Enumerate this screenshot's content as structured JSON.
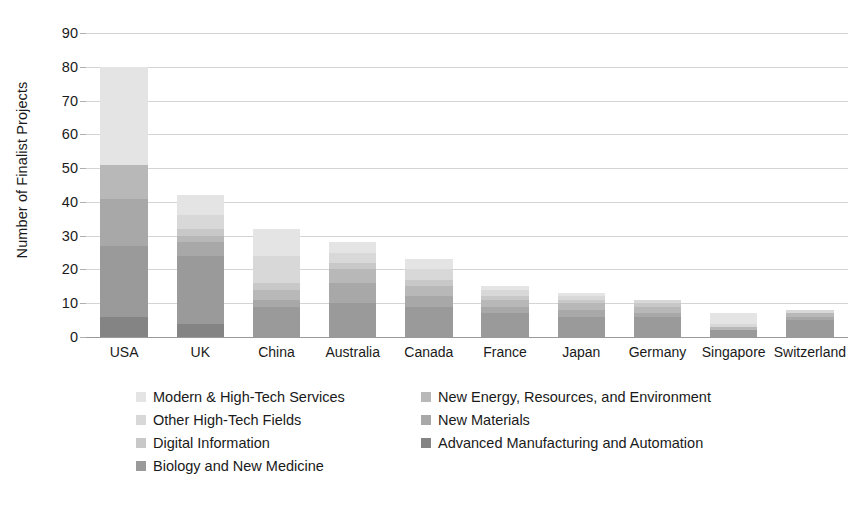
{
  "chart_data": {
    "type": "bar",
    "subtype": "stacked-bar",
    "title": "",
    "xlabel": "",
    "ylabel": "Number of Finalist Projects",
    "ylim": [
      0,
      90
    ],
    "ytick_step": 10,
    "yticks": [
      0,
      10,
      20,
      30,
      40,
      50,
      60,
      70,
      80,
      90
    ],
    "grid": true,
    "grid_axis": "y",
    "legend_position": "bottom",
    "categories": [
      "USA",
      "UK",
      "China",
      "Australia",
      "Canada",
      "France",
      "Japan",
      "Germany",
      "Singapore",
      "Switzerland"
    ],
    "series": [
      {
        "name": "Advanced Manufacturing and Automation",
        "color": "#848484",
        "values": [
          6,
          4,
          0,
          0,
          0,
          0,
          0,
          0,
          0,
          0
        ]
      },
      {
        "name": "Biology and New Medicine",
        "color": "#9a9a9a",
        "values": [
          21,
          20,
          9,
          10,
          9,
          7,
          6,
          6,
          2,
          5
        ]
      },
      {
        "name": "New Materials",
        "color": "#a8a8a8",
        "values": [
          14,
          4,
          2,
          6,
          3,
          2,
          2,
          1,
          0,
          1
        ]
      },
      {
        "name": "New Energy, Resources, and Environment",
        "color": "#b8b8b8",
        "values": [
          10,
          2,
          3,
          4,
          3,
          2,
          2,
          2,
          1,
          1
        ]
      },
      {
        "name": "Digital Information",
        "color": "#c8c8c8",
        "values": [
          0,
          2,
          2,
          2,
          2,
          1,
          1,
          1,
          0,
          0
        ]
      },
      {
        "name": "Other High-Tech Fields",
        "color": "#d8d8d8",
        "values": [
          0,
          4,
          8,
          3,
          3,
          2,
          1,
          1,
          1,
          1
        ]
      },
      {
        "name": "Modern & High-Tech Services",
        "color": "#e4e4e4",
        "values": [
          29,
          6,
          8,
          3,
          3,
          1,
          1,
          0,
          3,
          0
        ]
      }
    ],
    "totals": [
      80,
      42,
      32,
      28,
      23,
      15,
      13,
      11,
      7,
      8
    ]
  },
  "legend": {
    "left_column": [
      {
        "label": "Modern & High-Tech Services",
        "color": "#e4e4e4"
      },
      {
        "label": "Other High-Tech Fields",
        "color": "#d8d8d8"
      },
      {
        "label": "Digital Information",
        "color": "#c8c8c8"
      },
      {
        "label": "Biology and New Medicine",
        "color": "#9a9a9a"
      }
    ],
    "right_column": [
      {
        "label": "New Energy, Resources, and Environment",
        "color": "#b8b8b8"
      },
      {
        "label": "New Materials",
        "color": "#a8a8a8"
      },
      {
        "label": "Advanced Manufacturing and Automation",
        "color": "#848484"
      }
    ]
  },
  "axes": {
    "y_title": "Number of Finalist Projects",
    "y_tick_labels": [
      "90",
      "80",
      "70",
      "60",
      "50",
      "40",
      "30",
      "20",
      "10",
      "0"
    ],
    "x_tick_labels": [
      "USA",
      "UK",
      "China",
      "Australia",
      "Canada",
      "France",
      "Japan",
      "Germany",
      "Singapore",
      "Switzerland"
    ]
  },
  "colors": {
    "gridline": "#d4d4d4",
    "axis": "#9a9a9a",
    "text": "#1a1a1a",
    "background": "#ffffff"
  }
}
